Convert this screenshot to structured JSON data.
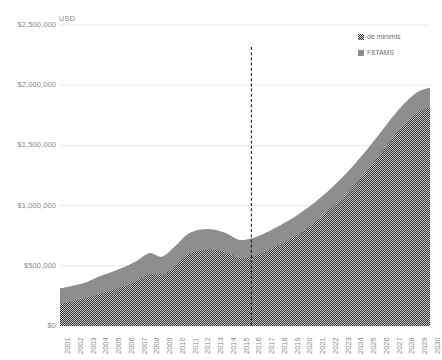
{
  "chart_data": {
    "type": "area",
    "stacked": true,
    "title": "",
    "subtitle": "",
    "xlabel": "",
    "ylabel": "USD",
    "unit_label": "USD",
    "grid": true,
    "legend_position": "top-right",
    "ylim": [
      0,
      2500000
    ],
    "ytick_labels": [
      "$2,500,000",
      "$2,000,000",
      "$1,500,000",
      "$1,000,000",
      "$500,000",
      "$0"
    ],
    "ytick_values": [
      2500000,
      2000000,
      1500000,
      1000000,
      500000,
      0
    ],
    "categories": [
      "2001",
      "2002",
      "2003",
      "2004",
      "2005",
      "2006",
      "2007",
      "2008",
      "2009",
      "2010",
      "2011",
      "2012",
      "2013",
      "2014",
      "2015",
      "2016",
      "2017",
      "2018",
      "2019",
      "2020",
      "2021",
      "2022",
      "2023",
      "2024",
      "2025",
      "2026",
      "2027",
      "2028",
      "2029",
      "2030"
    ],
    "series": [
      {
        "name": "F8TAMS",
        "color": "#3f3f3f",
        "pattern": "checker",
        "order": "bottom",
        "values": [
          185000,
          205000,
          230000,
          262000,
          295000,
          330000,
          372000,
          430000,
          428000,
          495000,
          590000,
          630000,
          632000,
          612000,
          565000,
          572000,
          610000,
          662000,
          718000,
          785000,
          862000,
          950000,
          1048000,
          1158000,
          1282000,
          1415000,
          1552000,
          1678000,
          1770000,
          1818000
        ]
      },
      {
        "name": "de minimis",
        "color": "#8e8e8e",
        "pattern": "solid",
        "order": "top",
        "values": [
          128000,
          130000,
          132000,
          148000,
          152000,
          158000,
          168000,
          175000,
          148000,
          165000,
          172000,
          172000,
          170000,
          160000,
          152000,
          155000,
          158000,
          160000,
          162000,
          165000,
          168000,
          170000,
          172000,
          175000,
          175000,
          175000,
          175000,
          172000,
          172000,
          160000
        ]
      }
    ],
    "totals": [
      313000,
      335000,
      362000,
      410000,
      447000,
      488000,
      540000,
      605000,
      576000,
      660000,
      762000,
      802000,
      802000,
      772000,
      717000,
      727000,
      768000,
      822000,
      880000,
      950000,
      1030000,
      1120000,
      1220000,
      1333000,
      1457000,
      1590000,
      1727000,
      1850000,
      1942000,
      1978000
    ],
    "annotations": [
      {
        "type": "vertical-dashed-line",
        "at_category": "2016",
        "color": "#222222",
        "label": ""
      }
    ]
  },
  "legend": {
    "items": [
      {
        "label": "de minimis",
        "swatch": "de-minimis-swatch"
      },
      {
        "label": "F8TAMS",
        "swatch": "f8tams-swatch"
      }
    ]
  },
  "colors": {
    "de_minimis": "#3f3f3f",
    "f8tams": "#8e8e8e",
    "gridline": "#e3e3e3",
    "axis_text": "#8a8a8a",
    "divider_line": "#222222",
    "background": "#ffffff"
  }
}
